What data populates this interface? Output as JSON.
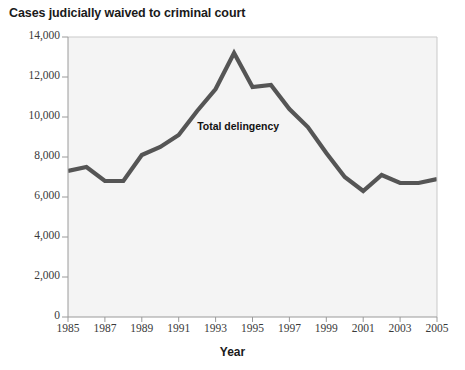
{
  "chart_data": {
    "type": "line",
    "title": "Cases judicially waived to criminal court",
    "xlabel": "Year",
    "ylabel": "",
    "xlim": [
      1985,
      2005
    ],
    "ylim": [
      0,
      14000
    ],
    "grid": false,
    "legend_position": "inline-annotation",
    "x": [
      1985,
      1986,
      1987,
      1988,
      1989,
      1990,
      1991,
      1992,
      1993,
      1994,
      1995,
      1996,
      1997,
      1998,
      1999,
      2000,
      2001,
      2002,
      2003,
      2004,
      2005
    ],
    "series": [
      {
        "name": "Total delingency",
        "values": [
          7300,
          7500,
          6800,
          6800,
          8100,
          8500,
          9100,
          10300,
          11400,
          13200,
          11500,
          11600,
          10400,
          9500,
          8200,
          7000,
          6300,
          7100,
          6700,
          6700,
          6900
        ]
      }
    ],
    "annotations": [
      {
        "text": "Total delingency",
        "x": 1992.0,
        "y": 9500
      }
    ],
    "yticks": [
      0,
      2000,
      4000,
      6000,
      8000,
      10000,
      12000,
      14000
    ],
    "ytick_labels": [
      "0",
      "2,000",
      "4,000",
      "6,000",
      "8,000",
      "10,000",
      "12,000",
      "14,000"
    ],
    "xticks": [
      1985,
      1987,
      1989,
      1991,
      1993,
      1995,
      1997,
      1999,
      2001,
      2003,
      2005
    ],
    "xtick_labels": [
      "1985",
      "1987",
      "1989",
      "1991",
      "1993",
      "1995",
      "1997",
      "1999",
      "2001",
      "2003",
      "2005"
    ],
    "colors": {
      "line": "#555555",
      "plot_background": "#f4f4f4",
      "figure_background": "#ffffff",
      "axis": "#9a9a9a",
      "text": "#1a1a1a",
      "tick_text": "#3a3a3a"
    }
  }
}
